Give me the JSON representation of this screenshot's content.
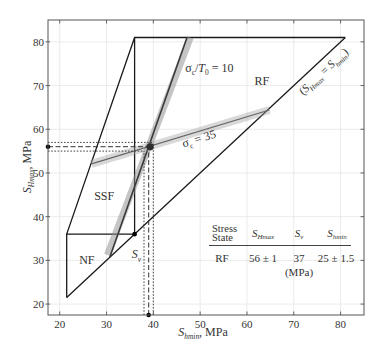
{
  "chart_data": {
    "type": "line",
    "title": "",
    "xlabel": "S_hmin, MPa",
    "ylabel": "S_Hmax, MPa",
    "xlabel_parts": [
      {
        "t": "S",
        "italic": true
      },
      {
        "t": "hmin",
        "sub": true,
        "italic": true
      },
      {
        "t": ", MPa"
      }
    ],
    "ylabel_parts": [
      {
        "t": "S",
        "italic": true
      },
      {
        "t": "Hmax",
        "sub": true,
        "italic": true
      },
      {
        "t": ", MPa"
      }
    ],
    "xlim": [
      17.5,
      85
    ],
    "ylim": [
      17.5,
      85
    ],
    "xticks": [
      20,
      30,
      40,
      50,
      60,
      70,
      80
    ],
    "yticks": [
      20,
      30,
      40,
      50,
      60,
      70,
      80
    ],
    "grid": true,
    "legend": null,
    "series": [
      {
        "name": "S_Hmax = S_hmin",
        "style": "solid",
        "color": "#1a1a1a",
        "width": 1.3,
        "points": [
          [
            21.5,
            21.5
          ],
          [
            81,
            81
          ]
        ]
      },
      {
        "name": "NF region boundary",
        "style": "solid",
        "color": "#1a1a1a",
        "width": 1.3,
        "points": [
          [
            21.5,
            21.5
          ],
          [
            21.5,
            36
          ],
          [
            36,
            36
          ]
        ]
      },
      {
        "name": "SSF region boundary",
        "style": "solid",
        "color": "#1a1a1a",
        "width": 1.3,
        "points": [
          [
            21.5,
            36
          ],
          [
            36,
            81
          ],
          [
            81,
            81
          ]
        ]
      },
      {
        "name": "Sv vertical boundary",
        "style": "solid",
        "color": "#1a1a1a",
        "width": 1.3,
        "points": [
          [
            36,
            36
          ],
          [
            36,
            81
          ]
        ]
      },
      {
        "name": "sigma_c/T0 = 10 uncertainty band",
        "style": "band",
        "color": "#8c8c8c",
        "width": 7,
        "opacity": 0.5,
        "points": [
          [
            30.2,
            31.2
          ],
          [
            47.9,
            81
          ]
        ]
      },
      {
        "name": "sigma_c/T0 = 10",
        "style": "solid",
        "color": "#3a3a3a",
        "width": 1.6,
        "points": [
          [
            30.7,
            30.7
          ],
          [
            47.2,
            81
          ]
        ]
      },
      {
        "name": "sigma_c = 35 uncertainty band",
        "style": "band",
        "color": "#a0a0a0",
        "width": 8,
        "opacity": 0.4,
        "points": [
          [
            26.8,
            52.1
          ],
          [
            64.8,
            64.4
          ]
        ]
      },
      {
        "name": "sigma_c = 35",
        "style": "solid",
        "color": "#666666",
        "width": 1.3,
        "points": [
          [
            26.8,
            52.1
          ],
          [
            64.8,
            64.4
          ]
        ]
      },
      {
        "name": "SHmax estimate",
        "style": "dashed",
        "color": "#333333",
        "width": 1,
        "points": [
          [
            17.5,
            56
          ],
          [
            39.3,
            56
          ]
        ]
      },
      {
        "name": "SHmax upper bound",
        "style": "dotted",
        "color": "#333333",
        "width": 0.9,
        "points": [
          [
            17.5,
            57
          ],
          [
            40,
            57
          ]
        ]
      },
      {
        "name": "SHmax lower bound",
        "style": "dotted",
        "color": "#333333",
        "width": 0.9,
        "points": [
          [
            17.5,
            55
          ],
          [
            38,
            55
          ]
        ]
      },
      {
        "name": "Shmin estimate",
        "style": "dashed",
        "color": "#333333",
        "width": 1,
        "points": [
          [
            39,
            17.5
          ],
          [
            39,
            56
          ]
        ]
      },
      {
        "name": "Shmin upper bound",
        "style": "dotted",
        "color": "#333333",
        "width": 0.9,
        "points": [
          [
            40,
            17.5
          ],
          [
            40,
            57
          ]
        ]
      },
      {
        "name": "Shmin lower bound",
        "style": "dotted",
        "color": "#333333",
        "width": 0.9,
        "points": [
          [
            38,
            17.5
          ],
          [
            38,
            55
          ]
        ]
      }
    ],
    "markers": [
      {
        "name": "sv-point",
        "x": 36,
        "y": 36,
        "r": 2.3,
        "color": "#000000"
      },
      {
        "name": "stress-estimate-point",
        "x": 39.3,
        "y": 56,
        "r": 3.6,
        "color": "#2e2e2e"
      },
      {
        "name": "shmax-axis-marker",
        "x": 17.5,
        "y": 56,
        "r": 2.3,
        "color": "#000000"
      },
      {
        "name": "shmin-axis-marker",
        "x": 39,
        "y": 17.5,
        "r": 2.3,
        "color": "#000000"
      }
    ],
    "annotations": [
      {
        "name": "sigma-c-t0-label",
        "x": 46.8,
        "y": 73.1,
        "anchor": "start",
        "rotate": 0,
        "size": 12,
        "parts": [
          {
            "t": "σ"
          },
          {
            "t": "c",
            "sub": true
          },
          {
            "t": "/"
          },
          {
            "t": "T",
            "italic": true
          },
          {
            "t": "0",
            "sub": true
          },
          {
            "t": " = 10"
          }
        ]
      },
      {
        "name": "rf-region-label",
        "x": 63.2,
        "y": 70.1,
        "anchor": "middle",
        "rotate": 0,
        "size": 12,
        "parts": [
          {
            "t": "RF"
          }
        ]
      },
      {
        "name": "equality-line-label",
        "x": 76.9,
        "y": 72.6,
        "anchor": "middle",
        "rotate": -43,
        "size": 11.5,
        "parts": [
          {
            "t": "("
          },
          {
            "t": "S",
            "italic": true
          },
          {
            "t": "Hmax",
            "sub": true,
            "italic": true
          },
          {
            "t": " = "
          },
          {
            "t": "S",
            "italic": true
          },
          {
            "t": "hmin",
            "sub": true,
            "italic": true
          },
          {
            "t": ")"
          }
        ]
      },
      {
        "name": "sigma-c-35-label",
        "x": 50.0,
        "y": 57.0,
        "anchor": "middle",
        "rotate": -17,
        "size": 12,
        "parts": [
          {
            "t": "σ"
          },
          {
            "t": "c",
            "sub": true
          },
          {
            "t": " = 35"
          }
        ]
      },
      {
        "name": "ssf-region-label",
        "x": 29.5,
        "y": 43.8,
        "anchor": "middle",
        "rotate": 0,
        "size": 12,
        "parts": [
          {
            "t": "SSF"
          }
        ]
      },
      {
        "name": "nf-region-label",
        "x": 25.8,
        "y": 29.2,
        "anchor": "middle",
        "rotate": 0,
        "size": 12,
        "parts": [
          {
            "t": "NF"
          }
        ]
      },
      {
        "name": "sv-point-label",
        "x": 35.4,
        "y": 30.5,
        "anchor": "start",
        "rotate": 0,
        "size": 12,
        "parts": [
          {
            "t": "S",
            "italic": true
          },
          {
            "t": "v",
            "sub": true,
            "italic": true
          }
        ]
      }
    ],
    "table": {
      "header": {
        "col1_line1": "Stress",
        "col1_line2": "State",
        "col2": {
          "main": "S",
          "sub": "Hmax"
        },
        "col3": {
          "main": "S",
          "sub": "v"
        },
        "col4": {
          "main": "S",
          "sub": "hmin"
        }
      },
      "rows": [
        {
          "state": "RF",
          "SHmax": "56 ± 1",
          "Sv": "37",
          "Shmin": "25 ± 1.5"
        }
      ],
      "unit": "(MPa)"
    }
  }
}
